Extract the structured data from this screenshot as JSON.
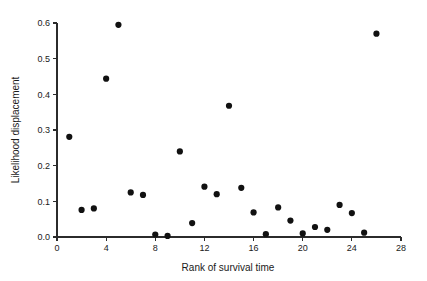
{
  "chart_data": {
    "type": "scatter",
    "title": "",
    "xlabel": "Rank of survival time",
    "ylabel": "Likelihood displacement",
    "xlim": [
      0,
      28
    ],
    "ylim": [
      0.0,
      0.6
    ],
    "grid": false,
    "legend": "none",
    "marker": {
      "shape": "circle",
      "color": "#111111",
      "size_px": 3.1
    },
    "xticks": [
      0,
      4,
      8,
      12,
      16,
      20,
      24,
      28
    ],
    "xtick_labels": [
      "0",
      "4",
      "8",
      "12",
      "16",
      "20",
      "24",
      "28"
    ],
    "yticks": [
      0.0,
      0.1,
      0.2,
      0.3,
      0.4,
      0.5,
      0.6
    ],
    "ytick_labels": [
      "0.0",
      "0.1",
      "0.2",
      "0.3",
      "0.4",
      "0.5",
      "0.6"
    ],
    "x": [
      1,
      2,
      3,
      4,
      5,
      6,
      7,
      8,
      9,
      10,
      11,
      12,
      13,
      14,
      15,
      16,
      17,
      18,
      19,
      20,
      21,
      22,
      23,
      24,
      25,
      26
    ],
    "y": [
      0.281,
      0.076,
      0.08,
      0.444,
      0.595,
      0.125,
      0.118,
      0.007,
      0.003,
      0.24,
      0.039,
      0.141,
      0.12,
      0.368,
      0.138,
      0.069,
      0.008,
      0.083,
      0.046,
      0.01,
      0.028,
      0.02,
      0.09,
      0.067,
      0.012,
      0.57
    ],
    "points": [
      {
        "x": 1,
        "y": 0.281
      },
      {
        "x": 2,
        "y": 0.076
      },
      {
        "x": 3,
        "y": 0.08
      },
      {
        "x": 4,
        "y": 0.444
      },
      {
        "x": 5,
        "y": 0.595
      },
      {
        "x": 6,
        "y": 0.125
      },
      {
        "x": 7,
        "y": 0.118
      },
      {
        "x": 8,
        "y": 0.007
      },
      {
        "x": 9,
        "y": 0.003
      },
      {
        "x": 10,
        "y": 0.24
      },
      {
        "x": 11,
        "y": 0.039
      },
      {
        "x": 12,
        "y": 0.141
      },
      {
        "x": 13,
        "y": 0.12
      },
      {
        "x": 14,
        "y": 0.368
      },
      {
        "x": 15,
        "y": 0.138
      },
      {
        "x": 16,
        "y": 0.069
      },
      {
        "x": 17,
        "y": 0.008
      },
      {
        "x": 18,
        "y": 0.083
      },
      {
        "x": 19,
        "y": 0.046
      },
      {
        "x": 20,
        "y": 0.01
      },
      {
        "x": 21,
        "y": 0.028
      },
      {
        "x": 22,
        "y": 0.02
      },
      {
        "x": 23,
        "y": 0.09
      },
      {
        "x": 24,
        "y": 0.067
      },
      {
        "x": 25,
        "y": 0.012
      },
      {
        "x": 26,
        "y": 0.57
      }
    ]
  },
  "colors": {
    "background": "#ffffff",
    "axis": "#2b2b2b",
    "text": "#1a1a1a",
    "marker": "#111111"
  }
}
